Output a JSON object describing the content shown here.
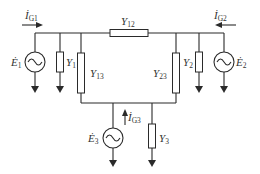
{
  "diagram": {
    "type": "circuit",
    "labels": {
      "IG1": {
        "main": "İ",
        "sub": "G1"
      },
      "IG2": {
        "main": "İ",
        "sub": "G2"
      },
      "IG3": {
        "main": "İ",
        "sub": "G3"
      },
      "E1": {
        "main": "Ė",
        "sub": "1"
      },
      "E2": {
        "main": "Ė",
        "sub": "2"
      },
      "E3": {
        "main": "Ė",
        "sub": "3"
      },
      "Y1": {
        "main": "Y",
        "sub": "1"
      },
      "Y2": {
        "main": "Y",
        "sub": "2"
      },
      "Y3": {
        "main": "Y",
        "sub": "3"
      },
      "Y12": {
        "main": "Y",
        "sub": "12"
      },
      "Y13": {
        "main": "Y",
        "sub": "13"
      },
      "Y23": {
        "main": "Y",
        "sub": "23"
      }
    },
    "components": [
      "E1 voltage source",
      "Y1 admittance",
      "Y13 admittance",
      "Y12 admittance",
      "Y23 admittance",
      "Y2 admittance",
      "E2 voltage source",
      "E3 voltage source",
      "Y3 admittance"
    ],
    "colors": {
      "line": "#2a2a2a",
      "text": "#333333",
      "background": "#ffffff"
    }
  }
}
